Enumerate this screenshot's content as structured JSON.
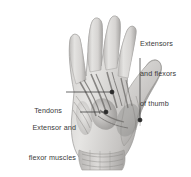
{
  "figure": {
    "subject": "hand",
    "view": "dorsal-palmar anatomical illustration",
    "background_color": "#ffffff",
    "text_color": "#3a3a3a",
    "leader_line_color": "#2b2b2b",
    "illustration_tones": {
      "skin_light": "#e8e7e5",
      "skin_mid": "#cfcdcb",
      "skin_shadow": "#a9a7a5",
      "muscle_dark": "#8d8b89",
      "tendon_line": "#6f6d6b",
      "outline": "#9a9896"
    }
  },
  "labels": [
    {
      "id": "extensors-flexors-thumb",
      "lines": [
        "Extensors",
        "and flexors",
        "of thumb"
      ],
      "align": "left",
      "leader": {
        "from_x": 140,
        "from_y": 58,
        "to_x": 140,
        "to_y": 120
      },
      "dot": {
        "x": 140,
        "y": 120
      }
    },
    {
      "id": "tendons",
      "lines": [
        "Tendons"
      ],
      "align": "right",
      "leader": {
        "from_x": 66,
        "from_y": 92,
        "to_x": 112,
        "to_y": 92
      },
      "dot": {
        "x": 112,
        "y": 92
      }
    },
    {
      "id": "extensor-flexor-muscles-of-hand",
      "lines": [
        "Extensor and",
        "flexor muscles",
        "of hand"
      ],
      "align": "right",
      "leader": {
        "from_x": 80,
        "from_y": 112,
        "to_x": 106,
        "to_y": 112
      },
      "dot": {
        "x": 106,
        "y": 112
      }
    }
  ]
}
